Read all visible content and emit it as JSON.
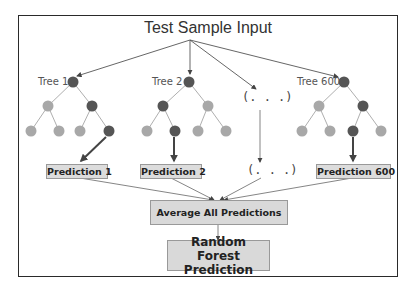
{
  "diagram": {
    "title": "Test Sample Input",
    "trees": [
      {
        "label": "Tree 1",
        "prediction": "Prediction 1"
      },
      {
        "label": "Tree 2",
        "prediction": "Prediction 2"
      },
      {
        "label": "(. . .)",
        "prediction": "(. . .)"
      },
      {
        "label": "Tree 600",
        "prediction": "Prediction 600"
      }
    ],
    "aggregate": "Average All Predictions",
    "output_line1": "Random Forest",
    "output_line2": "Prediction",
    "colors": {
      "dark_node": "#555555",
      "light_node": "#a8a8a8",
      "box_fill": "#d9d9d9",
      "frame": "#2a2a2a",
      "edge": "#888888",
      "arrow": "#444444"
    }
  }
}
